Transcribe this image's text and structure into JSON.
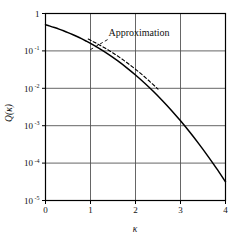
{
  "chart_data": {
    "type": "line",
    "title": "",
    "xlabel": "κ",
    "ylabel": "Q(κ)",
    "xlim": [
      0,
      4
    ],
    "ylim": [
      1e-05,
      1
    ],
    "yscale": "log",
    "xscale": "linear",
    "grid": true,
    "legend_position": "inline-annotation",
    "xticks": [
      "0",
      "1",
      "2",
      "3",
      "4"
    ],
    "xtick_values": [
      0,
      1,
      2,
      3,
      4
    ],
    "yticks": [
      "1",
      "10⁻¹",
      "10⁻²",
      "10⁻³",
      "10⁻⁴",
      "10⁻⁵"
    ],
    "ytick_mantissa": [
      "1",
      "10",
      "10",
      "10",
      "10",
      "10"
    ],
    "ytick_exponent": [
      "",
      "-1",
      "-2",
      "-3",
      "-4",
      "-5"
    ],
    "ytick_values": [
      1,
      0.1,
      0.01,
      0.001,
      0.0001,
      1e-05
    ],
    "annotations": [
      {
        "text": "Approximation",
        "x": 1.4,
        "y": 0.25,
        "leader_from_x": 1.38,
        "leader_from_y": 0.22,
        "leader_to_x": 0.95,
        "leader_to_y": 0.1
      }
    ],
    "series": [
      {
        "name": "Q(κ)",
        "style": "solid",
        "color": "#000000",
        "x": [
          0,
          0.1,
          0.2,
          0.3,
          0.4,
          0.5,
          0.6,
          0.7,
          0.8,
          0.9,
          1.0,
          1.2,
          1.4,
          1.6,
          1.8,
          2.0,
          2.2,
          2.4,
          2.6,
          2.8,
          3.0,
          3.2,
          3.4,
          3.6,
          3.8,
          4.0
        ],
        "y": [
          0.5,
          0.4602,
          0.4207,
          0.3821,
          0.3446,
          0.3085,
          0.2743,
          0.242,
          0.2119,
          0.1841,
          0.1587,
          0.1151,
          0.0808,
          0.0548,
          0.0359,
          0.02275,
          0.0139,
          0.0082,
          0.00466,
          0.00256,
          0.00135,
          0.000687,
          0.000337,
          0.000159,
          7.23e-05,
          3.17e-05
        ]
      },
      {
        "name": "Approximation",
        "style": "dashed",
        "color": "#000000",
        "x": [
          0.95,
          1.1,
          1.3,
          1.5,
          1.7,
          1.9,
          2.1,
          2.3,
          2.5
        ],
        "y": [
          0.2076,
          0.1669,
          0.1233,
          0.0879,
          0.0605,
          0.0402,
          0.0258,
          0.0159,
          0.00952
        ]
      }
    ]
  },
  "axes": {
    "y_axis_title": "Q(κ)",
    "x_axis_title": "κ"
  },
  "colors": {
    "curve": "#000000",
    "grid": "#555555",
    "frame": "#000000",
    "background": "#ffffff",
    "text": "#111111"
  }
}
